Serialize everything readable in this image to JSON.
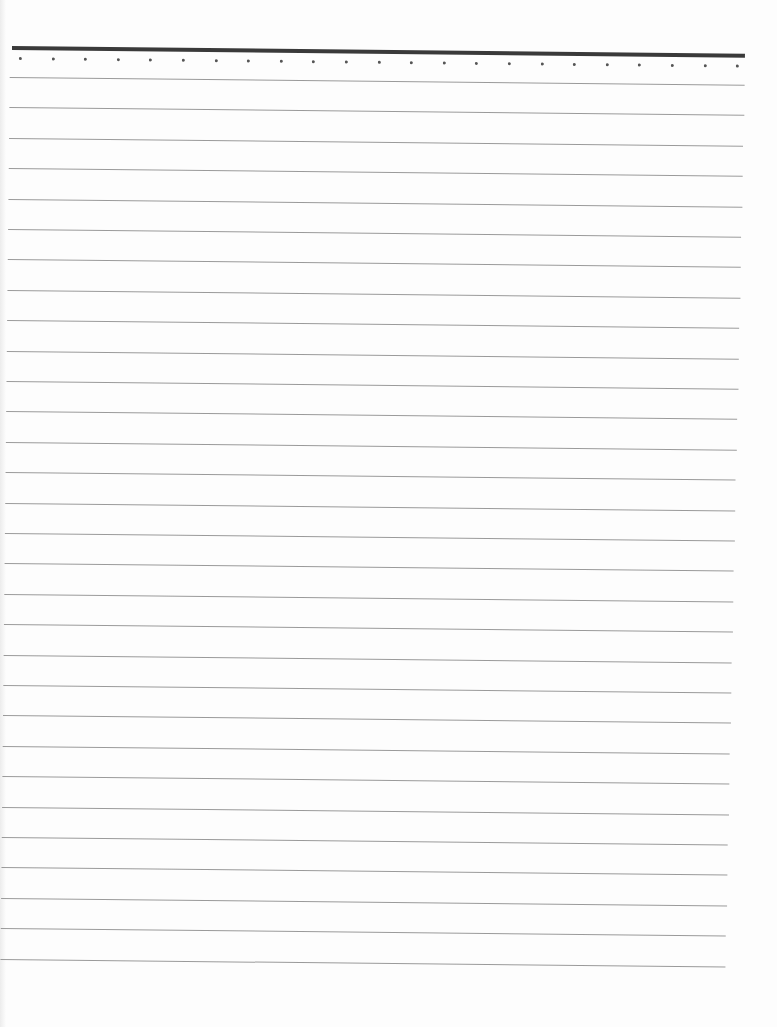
{
  "page": {
    "type": "lined-paper",
    "background": "#fdfdfd",
    "top_rule": {
      "color": "#3a3a3a",
      "thickness_px": 4
    },
    "dot_row": {
      "count": 23,
      "color": "#555555"
    },
    "ruled_lines": {
      "count": 30,
      "color": "#9a9a9a",
      "spacing_px": 30.4
    },
    "text_content": []
  }
}
